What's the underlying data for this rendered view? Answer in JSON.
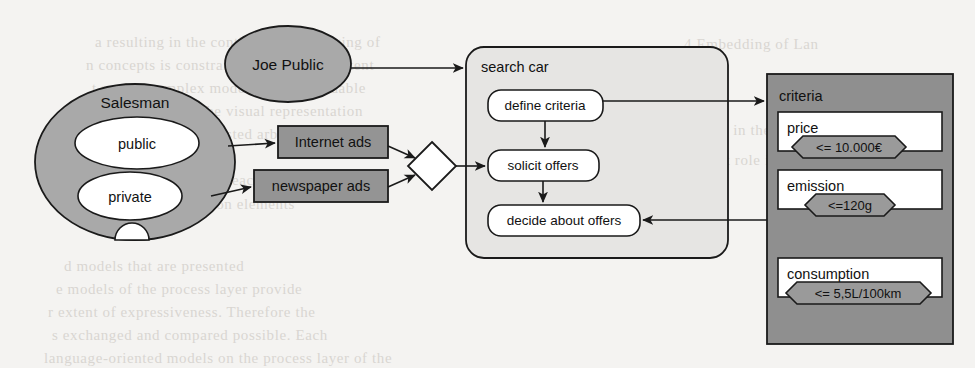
{
  "palette": {
    "page_background": "#f4f3f1",
    "bleed_text": "#d9d6d2",
    "stroke": "#1a1a1a",
    "actor_fill": "#a9a9a9",
    "box_fill": "#949494",
    "pool_fill": "#e6e5e3",
    "object_fill": "#8f8f8f",
    "white_fill": "#ffffff"
  },
  "actors": {
    "salesman": {
      "label": "Salesman",
      "roles": [
        {
          "label": "public"
        },
        {
          "label": "private"
        }
      ]
    },
    "joe_public": {
      "label": "Joe Public"
    }
  },
  "channels": [
    {
      "label": "Internet ads"
    },
    {
      "label": "newspaper ads"
    }
  ],
  "gateway": {
    "name": "merge-gateway",
    "label": ""
  },
  "process": {
    "label": "search car",
    "activities": [
      {
        "label": "define criteria"
      },
      {
        "label": "solicit offers"
      },
      {
        "label": "decide about offers"
      }
    ]
  },
  "data_object": {
    "label": "criteria",
    "items": [
      {
        "label": "price",
        "constraint": "<= 10.000€"
      },
      {
        "label": "emission",
        "constraint": "<=120g"
      },
      {
        "label": "consumption",
        "constraint": "<= 5,5L/100km"
      }
    ]
  },
  "background_text": {
    "lines": [
      {
        "text": "a  resulting  in  the  continuous  rearranging  of",
        "x": 95,
        "y": 34
      },
      {
        "text": "n  concepts  is  constrained  to  a  certain  extent",
        "x": 86,
        "y": 57
      },
      {
        "text": "t  so  that  complex  models  remain  readable",
        "x": 92,
        "y": 80
      },
      {
        "text": "e  intuitively  in  the  visual  representation",
        "x": 100,
        "y": 103
      },
      {
        "text": "o  concepts  can  be  nested  arbitrarily",
        "x": 90,
        "y": 126
      },
      {
        "text": "t  are  placed  close  to  each  other",
        "x": 96,
        "y": 172
      },
      {
        "text": "n  the  same  notation  elements",
        "x": 104,
        "y": 196
      },
      {
        "text": "d  models  that  are  presented",
        "x": 64,
        "y": 258
      },
      {
        "text": "e  models  of  the  process  layer  provide",
        "x": 56,
        "y": 281
      },
      {
        "text": "r  extent  of  expressiveness.  Therefore  the",
        "x": 48,
        "y": 304
      },
      {
        "text": "s  exchanged  and  compared  possible.  Each",
        "x": 52,
        "y": 327
      },
      {
        "text": "language-oriented  models  on  the  process  layer  of  the",
        "x": 44,
        "y": 350
      },
      {
        "text": "4  Embedding  of  Lan",
        "x": 684,
        "y": 36
      },
      {
        "text": "ion  in  the  course",
        "x": 708,
        "y": 122
      },
      {
        "text": "rtant  role  in  the",
        "x": 700,
        "y": 152
      }
    ]
  }
}
